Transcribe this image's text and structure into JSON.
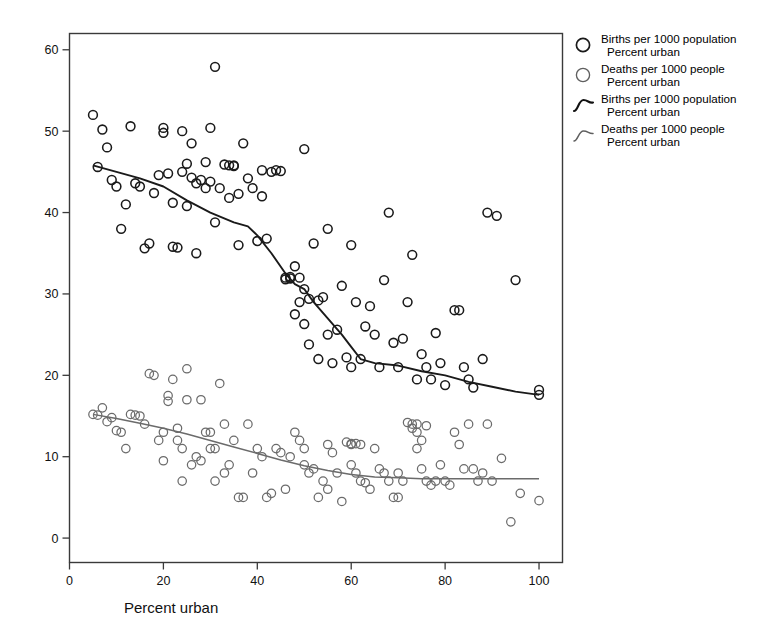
{
  "chart_data": {
    "type": "scatter",
    "title": "",
    "xlabel": "Percent urban",
    "ylabel": "",
    "xlim": [
      0,
      105
    ],
    "ylim": [
      -3,
      62
    ],
    "xticks": [
      0,
      20,
      40,
      60,
      80,
      100
    ],
    "yticks": [
      0,
      10,
      20,
      30,
      40,
      50,
      60
    ],
    "grid": false,
    "legend_position": "right-outside",
    "series": [
      {
        "name": "Births per 1000 population",
        "name2": "Percent urban",
        "marker": "open-circle",
        "color": "#1a1a1a",
        "points": [
          [
            5,
            52.0
          ],
          [
            6,
            45.6
          ],
          [
            7,
            50.2
          ],
          [
            8,
            48.0
          ],
          [
            9,
            44.0
          ],
          [
            10,
            43.2
          ],
          [
            11,
            38.0
          ],
          [
            12,
            41.0
          ],
          [
            13,
            50.6
          ],
          [
            14,
            43.6
          ],
          [
            15,
            43.2
          ],
          [
            16,
            35.6
          ],
          [
            17,
            36.2
          ],
          [
            18,
            42.4
          ],
          [
            19,
            44.6
          ],
          [
            20,
            49.8
          ],
          [
            20,
            50.4
          ],
          [
            21,
            44.8
          ],
          [
            22,
            41.2
          ],
          [
            22,
            35.8
          ],
          [
            23,
            35.7
          ],
          [
            24,
            45.0
          ],
          [
            24,
            50.0
          ],
          [
            25,
            46.0
          ],
          [
            25,
            40.8
          ],
          [
            26,
            44.3
          ],
          [
            26,
            48.5
          ],
          [
            27,
            43.6
          ],
          [
            27,
            35.0
          ],
          [
            28,
            44.0
          ],
          [
            29,
            43.0
          ],
          [
            29,
            46.2
          ],
          [
            30,
            50.4
          ],
          [
            30,
            43.8
          ],
          [
            31,
            57.9
          ],
          [
            31,
            38.8
          ],
          [
            32,
            43.0
          ],
          [
            33,
            45.9
          ],
          [
            34,
            45.8
          ],
          [
            34,
            41.8
          ],
          [
            35,
            45.8
          ],
          [
            35,
            45.7
          ],
          [
            36,
            42.3
          ],
          [
            36,
            36.0
          ],
          [
            37,
            48.5
          ],
          [
            38,
            44.2
          ],
          [
            39,
            43.0
          ],
          [
            40,
            36.5
          ],
          [
            41,
            45.2
          ],
          [
            41,
            42.0
          ],
          [
            42,
            36.8
          ],
          [
            43,
            45.0
          ],
          [
            44,
            45.2
          ],
          [
            45,
            45.1
          ],
          [
            46,
            32.0
          ],
          [
            46,
            31.8
          ],
          [
            47,
            32.1
          ],
          [
            47,
            31.9
          ],
          [
            48,
            33.4
          ],
          [
            48,
            27.5
          ],
          [
            49,
            32.0
          ],
          [
            49,
            29.0
          ],
          [
            50,
            47.8
          ],
          [
            50,
            30.6
          ],
          [
            50,
            26.3
          ],
          [
            51,
            29.4
          ],
          [
            51,
            23.8
          ],
          [
            52,
            36.2
          ],
          [
            53,
            29.2
          ],
          [
            53,
            22.0
          ],
          [
            54,
            29.6
          ],
          [
            55,
            38.0
          ],
          [
            55,
            25.0
          ],
          [
            56,
            21.5
          ],
          [
            57,
            25.6
          ],
          [
            58,
            31.0
          ],
          [
            59,
            22.2
          ],
          [
            60,
            36.0
          ],
          [
            60,
            21.0
          ],
          [
            61,
            29.0
          ],
          [
            62,
            22.0
          ],
          [
            63,
            26.0
          ],
          [
            64,
            28.5
          ],
          [
            65,
            25.0
          ],
          [
            66,
            21.0
          ],
          [
            67,
            31.7
          ],
          [
            68,
            40.0
          ],
          [
            69,
            24.0
          ],
          [
            70,
            21.0
          ],
          [
            71,
            24.5
          ],
          [
            72,
            29.0
          ],
          [
            73,
            34.8
          ],
          [
            74,
            19.5
          ],
          [
            75,
            22.6
          ],
          [
            76,
            21.0
          ],
          [
            77,
            19.5
          ],
          [
            78,
            25.2
          ],
          [
            79,
            21.5
          ],
          [
            80,
            18.8
          ],
          [
            82,
            28.0
          ],
          [
            83,
            28.0
          ],
          [
            84,
            21.0
          ],
          [
            85,
            19.5
          ],
          [
            86,
            18.5
          ],
          [
            88,
            22.0
          ],
          [
            89,
            40.0
          ],
          [
            91,
            39.6
          ],
          [
            95,
            31.7
          ],
          [
            100,
            17.6
          ],
          [
            100,
            18.2
          ]
        ]
      },
      {
        "name": "Deaths per 1000 people",
        "name2": "Percent urban",
        "marker": "open-circle",
        "color": "#6b6b6b",
        "points": [
          [
            5,
            15.2
          ],
          [
            6,
            15.1
          ],
          [
            7,
            16.0
          ],
          [
            8,
            14.3
          ],
          [
            9,
            14.8
          ],
          [
            10,
            13.2
          ],
          [
            11,
            13.0
          ],
          [
            12,
            11.0
          ],
          [
            13,
            15.2
          ],
          [
            14,
            15.1
          ],
          [
            15,
            15.0
          ],
          [
            16,
            14.0
          ],
          [
            17,
            20.2
          ],
          [
            18,
            20.0
          ],
          [
            19,
            12.0
          ],
          [
            20,
            13.0
          ],
          [
            20,
            9.5
          ],
          [
            21,
            17.5
          ],
          [
            21,
            16.8
          ],
          [
            22,
            19.5
          ],
          [
            23,
            13.5
          ],
          [
            23,
            12.0
          ],
          [
            24,
            11.0
          ],
          [
            24,
            7.0
          ],
          [
            25,
            20.8
          ],
          [
            25,
            17.0
          ],
          [
            26,
            9.0
          ],
          [
            27,
            10.0
          ],
          [
            28,
            17.0
          ],
          [
            28,
            9.5
          ],
          [
            29,
            13.0
          ],
          [
            30,
            13.0
          ],
          [
            30,
            11.0
          ],
          [
            31,
            11.0
          ],
          [
            31,
            7.0
          ],
          [
            32,
            19.0
          ],
          [
            33,
            14.0
          ],
          [
            33,
            8.0
          ],
          [
            34,
            9.0
          ],
          [
            35,
            12.0
          ],
          [
            36,
            5.0
          ],
          [
            37,
            5.0
          ],
          [
            38,
            14.0
          ],
          [
            39,
            8.0
          ],
          [
            40,
            11.0
          ],
          [
            41,
            10.0
          ],
          [
            42,
            5.0
          ],
          [
            43,
            5.5
          ],
          [
            44,
            11.0
          ],
          [
            45,
            10.5
          ],
          [
            46,
            6.0
          ],
          [
            47,
            10.0
          ],
          [
            48,
            13.0
          ],
          [
            49,
            12.0
          ],
          [
            50,
            11.0
          ],
          [
            50,
            9.0
          ],
          [
            51,
            8.0
          ],
          [
            52,
            8.5
          ],
          [
            53,
            5.0
          ],
          [
            54,
            7.0
          ],
          [
            55,
            11.5
          ],
          [
            55,
            6.0
          ],
          [
            56,
            10.5
          ],
          [
            57,
            8.0
          ],
          [
            58,
            4.5
          ],
          [
            59,
            11.8
          ],
          [
            60,
            11.6
          ],
          [
            60,
            11.5
          ],
          [
            60,
            9.0
          ],
          [
            61,
            11.6
          ],
          [
            61,
            8.0
          ],
          [
            62,
            11.5
          ],
          [
            62,
            7.0
          ],
          [
            63,
            6.8
          ],
          [
            64,
            6.0
          ],
          [
            65,
            11.0
          ],
          [
            66,
            8.5
          ],
          [
            67,
            8.0
          ],
          [
            68,
            7.0
          ],
          [
            69,
            5.0
          ],
          [
            70,
            5.0
          ],
          [
            70,
            8.0
          ],
          [
            71,
            7.0
          ],
          [
            72,
            14.2
          ],
          [
            73,
            14.0
          ],
          [
            73,
            13.5
          ],
          [
            74,
            14.0
          ],
          [
            74,
            13.0
          ],
          [
            74,
            11.0
          ],
          [
            75,
            12.0
          ],
          [
            75,
            8.5
          ],
          [
            76,
            13.8
          ],
          [
            76,
            7.0
          ],
          [
            77,
            6.5
          ],
          [
            78,
            7.0
          ],
          [
            79,
            9.0
          ],
          [
            80,
            7.0
          ],
          [
            81,
            6.5
          ],
          [
            82,
            13.0
          ],
          [
            83,
            11.5
          ],
          [
            84,
            8.5
          ],
          [
            85,
            14.0
          ],
          [
            86,
            8.5
          ],
          [
            87,
            7.0
          ],
          [
            88,
            8.0
          ],
          [
            89,
            14.0
          ],
          [
            90,
            7.0
          ],
          [
            92,
            9.8
          ],
          [
            94,
            2.0
          ],
          [
            96,
            5.5
          ],
          [
            100,
            4.6
          ]
        ]
      }
    ],
    "fit_lines": [
      {
        "name": "Births per 1000 population",
        "name2": "Percent urban",
        "color": "#1a1a1a",
        "width": 1.9,
        "points": [
          [
            5,
            45.8
          ],
          [
            10,
            45.0
          ],
          [
            15,
            44.2
          ],
          [
            20,
            43.2
          ],
          [
            25,
            41.5
          ],
          [
            30,
            40.0
          ],
          [
            35,
            38.8
          ],
          [
            38,
            38.3
          ],
          [
            40,
            37.2
          ],
          [
            43,
            35.0
          ],
          [
            46,
            32.5
          ],
          [
            48,
            31.2
          ],
          [
            50,
            30.6
          ],
          [
            52,
            29.0
          ],
          [
            55,
            27.0
          ],
          [
            58,
            25.0
          ],
          [
            60,
            23.5
          ],
          [
            62,
            22.0
          ],
          [
            65,
            21.5
          ],
          [
            70,
            21.2
          ],
          [
            75,
            20.5
          ],
          [
            80,
            20.0
          ],
          [
            85,
            19.2
          ],
          [
            90,
            18.6
          ],
          [
            95,
            18.0
          ],
          [
            100,
            17.6
          ]
        ]
      },
      {
        "name": "Deaths per 1000 people",
        "name2": "Percent urban",
        "color": "#6b6b6b",
        "width": 1.5,
        "points": [
          [
            5,
            15.2
          ],
          [
            10,
            14.7
          ],
          [
            15,
            14.1
          ],
          [
            20,
            13.5
          ],
          [
            25,
            12.8
          ],
          [
            30,
            12.0
          ],
          [
            35,
            11.2
          ],
          [
            40,
            10.4
          ],
          [
            45,
            9.6
          ],
          [
            50,
            8.9
          ],
          [
            55,
            8.3
          ],
          [
            60,
            7.8
          ],
          [
            65,
            7.5
          ],
          [
            70,
            7.4
          ],
          [
            75,
            7.3
          ],
          [
            80,
            7.3
          ],
          [
            85,
            7.3
          ],
          [
            90,
            7.3
          ],
          [
            95,
            7.3
          ],
          [
            100,
            7.3
          ]
        ]
      }
    ]
  },
  "axes": {
    "x_tick_labels": [
      "0",
      "20",
      "40",
      "60",
      "80",
      "100"
    ],
    "y_tick_labels": [
      "0",
      "10",
      "20",
      "30",
      "40",
      "50",
      "60"
    ],
    "x_axis_title": "Percent urban"
  },
  "legend": {
    "entries": [
      {
        "symbol": "open-circle",
        "color": "#1a1a1a",
        "line1": "Births per 1000 population",
        "line2": "Percent urban"
      },
      {
        "symbol": "open-circle",
        "color": "#6b6b6b",
        "line1": "Deaths per 1000 people",
        "line2": "Percent urban"
      },
      {
        "symbol": "curve",
        "color": "#1a1a1a",
        "line1": "Births per 1000 population",
        "line2": "Percent urban"
      },
      {
        "symbol": "curve",
        "color": "#6b6b6b",
        "line1": "Deaths per 1000 people",
        "line2": "Percent urban"
      }
    ]
  },
  "colors": {
    "births": "#1a1a1a",
    "deaths": "#6b6b6b",
    "frame": "#3a3a3a",
    "background": "#ffffff"
  }
}
